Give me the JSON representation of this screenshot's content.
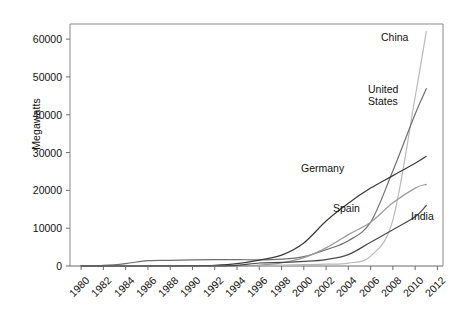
{
  "chart_data": {
    "type": "line",
    "title": "",
    "xlabel": "",
    "ylabel": "Megawatts",
    "xlim": [
      1979,
      2012.5
    ],
    "ylim": [
      0,
      64000
    ],
    "grid": false,
    "legend_position": "inline-annotations",
    "xticks": [
      "1980",
      "1982",
      "1984",
      "1986",
      "1988",
      "1990",
      "1992",
      "1994",
      "1996",
      "1998",
      "2000",
      "2002",
      "2004",
      "2006",
      "2008",
      "2010",
      "2012"
    ],
    "yticks": [
      "0",
      "10000",
      "20000",
      "30000",
      "40000",
      "50000",
      "60000"
    ],
    "x": [
      1980,
      1982,
      1984,
      1986,
      1988,
      1990,
      1992,
      1994,
      1996,
      1998,
      2000,
      2002,
      2004,
      2006,
      2008,
      2010,
      2011
    ],
    "series": [
      {
        "name": "China",
        "color": "#b9b9b9",
        "label": "China",
        "values": [
          0,
          0,
          0,
          0,
          10,
          20,
          50,
          80,
          120,
          220,
          350,
          470,
          760,
          2600,
          12200,
          44700,
          62000
        ]
      },
      {
        "name": "United States",
        "color": "#6f6f6f",
        "label": "United States",
        "values": [
          10,
          150,
          650,
          1400,
          1500,
          1600,
          1700,
          1700,
          1600,
          1800,
          2500,
          4300,
          6700,
          11600,
          25200,
          40200,
          46900
        ]
      },
      {
        "name": "Germany",
        "color": "#3a3a3a",
        "label": "Germany",
        "values": [
          0,
          0,
          0,
          10,
          30,
          60,
          180,
          620,
          1550,
          2870,
          6100,
          11900,
          16600,
          20600,
          23900,
          27200,
          29000
        ]
      },
      {
        "name": "Spain",
        "color": "#9a9a9a",
        "label": "Spain",
        "values": [
          0,
          0,
          0,
          0,
          0,
          10,
          50,
          70,
          230,
          830,
          2200,
          4800,
          8300,
          11600,
          16700,
          20600,
          21600
        ]
      },
      {
        "name": "India",
        "color": "#4a4a4a",
        "label": "India",
        "values": [
          0,
          0,
          0,
          0,
          0,
          30,
          40,
          180,
          800,
          950,
          1200,
          1700,
          3000,
          6300,
          9600,
          13000,
          16000
        ]
      }
    ]
  }
}
